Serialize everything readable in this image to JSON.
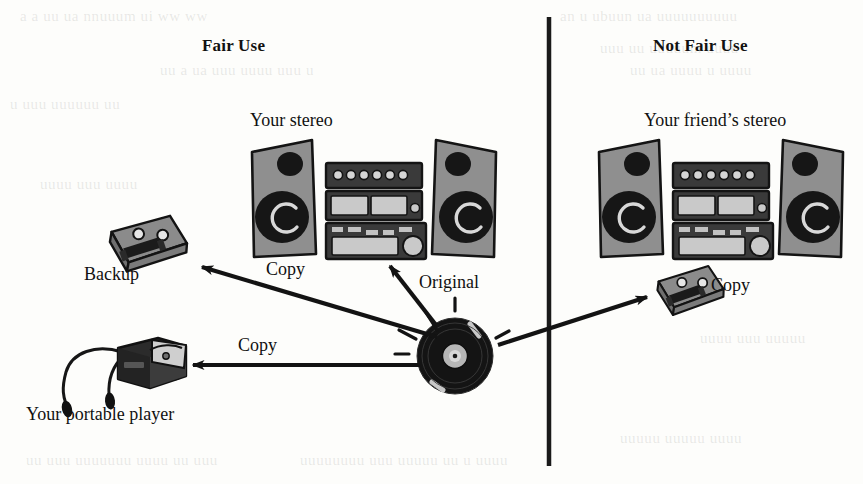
{
  "figure": {
    "background_color": "#fdfdfb",
    "ink_color": "#111111",
    "divider_color": "#1a1a1a"
  },
  "columns": {
    "left_title": "Fair Use",
    "right_title": "Not Fair Use"
  },
  "nodes": {
    "your_stereo_label": "Your stereo",
    "friend_stereo_label": "Your friend’s stereo",
    "backup_label": "Backup",
    "portable_label": "Your portable player",
    "friend_copy_label": "Copy"
  },
  "edges": {
    "record_to_backup": "Copy",
    "record_to_stereo": "Original",
    "record_to_portable": "Copy"
  },
  "ghost_text": [
    {
      "text": "a a uu ua  nnuuum  ui  ww  ww",
      "x": 20,
      "y": 8
    },
    {
      "text": "an u ubuun ua uuuuuuuuuu",
      "x": 560,
      "y": 8
    },
    {
      "text": "uu a ua  uuu uuuu uuu u",
      "x": 160,
      "y": 62
    },
    {
      "text": "uuu uu uuuuum uuuu",
      "x": 600,
      "y": 40
    },
    {
      "text": "uu ua  uuuu u uuuu",
      "x": 630,
      "y": 62
    },
    {
      "text": "u uuu  uuuuuu uu",
      "x": 10,
      "y": 96
    },
    {
      "text": "uuuu  uuu  uuuu",
      "x": 40,
      "y": 176
    },
    {
      "text": "uuuu uuu uuuuu",
      "x": 700,
      "y": 330
    },
    {
      "text": "uu uuu  uuuuuuu uuuu  uu uuu",
      "x": 26,
      "y": 452
    },
    {
      "text": "uuuuuuuu  uuu uuuuu uu u uuuu",
      "x": 300,
      "y": 452
    },
    {
      "text": "uuuuu uuuuu uuuu",
      "x": 620,
      "y": 430
    }
  ],
  "stereo_colors": {
    "cabinet": "#8f8f8f",
    "cabinet_dark": "#6f6f6f",
    "outline": "#141414",
    "cone": "#161616",
    "panel_light": "#c9c9c9",
    "deck_body": "#3a3a3a"
  },
  "record": {
    "disc_color": "#141414",
    "label_color": "#b6b6b6",
    "shine_color": "#e8e8e8"
  },
  "cassette_colors": {
    "shell": "#8b8b8b",
    "shell_light": "#a8a8a8",
    "outline": "#131313"
  },
  "player_colors": {
    "body": "#2b2b2b",
    "body_light": "#4a4a4a",
    "cord": "#161616"
  }
}
